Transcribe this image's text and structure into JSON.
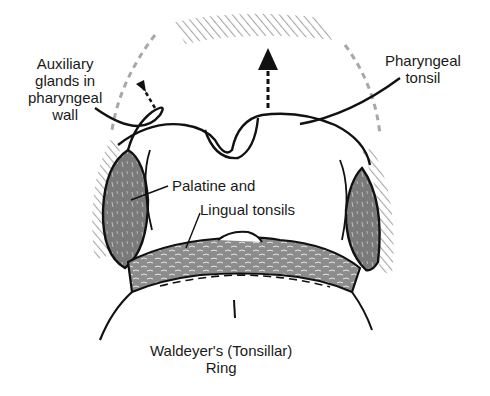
{
  "diagram": {
    "labels": {
      "auxiliary_glands": [
        "Auxiliary",
        "glands in",
        "pharyngeal",
        "wall"
      ],
      "pharyngeal_tonsil": [
        "Pharyngeal",
        "tonsil"
      ],
      "palatine_and": "Palatine and",
      "lingual_tonsils": "Lingual tonsils",
      "caption": [
        "Waldeyer's (Tonsillar)",
        "Ring"
      ]
    },
    "colors": {
      "ink": "#111111",
      "tonsil_fill": "#7a7a7a",
      "hatch": "#a8a8a8",
      "background": "#ffffff"
    }
  }
}
